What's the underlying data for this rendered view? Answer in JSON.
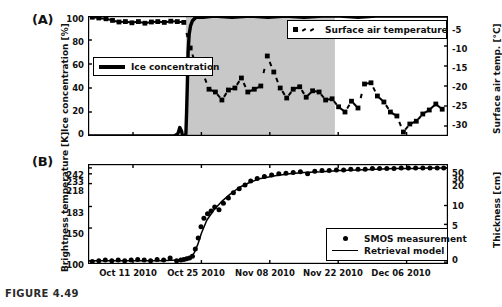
{
  "figure": {
    "caption": "FIGURE 4.49",
    "background_color": "#ffffff",
    "foreground_color": "#000000",
    "shade_color": "#c8c8c8"
  },
  "panels": [
    {
      "id": "A",
      "label": "(A)",
      "left_axis": {
        "title": "Ice concentration [%]",
        "ticks": [
          "0",
          "20",
          "40",
          "60",
          "80",
          "100"
        ],
        "tick_values": [
          0,
          20,
          40,
          60,
          80,
          100
        ],
        "range": [
          0,
          100
        ]
      },
      "right_axis": {
        "title": "Surface air temp. [°C]",
        "ticks": [
          "-5",
          "-10",
          "-15",
          "-20",
          "-25",
          "-30"
        ],
        "tick_values": [
          -5,
          -10,
          -15,
          -20,
          -25,
          -30
        ],
        "range": [
          -32.5,
          -2.5
        ]
      },
      "legends": [
        {
          "name": "ice-concentration-legend",
          "label": "Ice concentration",
          "key": "thick-line"
        },
        {
          "name": "surface-air-temperature-legend",
          "label": "Surface air temperature",
          "key": "dotted-square"
        }
      ],
      "shaded_region": {
        "x_start_frac": 0.272,
        "x_end_frac": 0.686
      }
    },
    {
      "id": "B",
      "label": "(B)",
      "left_axis": {
        "title": "Brightness temperature [K]",
        "ticks": [
          "242",
          "233",
          "218",
          "183",
          "150",
          "100"
        ],
        "tick_values": [
          242,
          233,
          218,
          183,
          150,
          100
        ],
        "range": [
          95,
          248
        ]
      },
      "right_axis": {
        "title": "Thickness [cm]",
        "ticks": [
          "50",
          "30",
          "20",
          "10",
          "5",
          "0"
        ],
        "tick_values": [
          50,
          30,
          20,
          10,
          5,
          0
        ],
        "range": [
          -1,
          52
        ]
      },
      "legends": [
        {
          "name": "smos-measurement-legend",
          "label": "SMOS measurement",
          "key": "dot"
        },
        {
          "name": "retrieval-model-legend",
          "label": "Retrieval model",
          "key": "thin-line"
        }
      ]
    }
  ],
  "x_axis": {
    "ticks": [
      "Oct 11 2010",
      "Oct 25 2010",
      "Nov 08 2010",
      "Nov 22 2010",
      "Dec 06 2010"
    ],
    "tick_fracs": [
      0.125,
      0.315,
      0.505,
      0.695,
      0.885
    ],
    "range_label": "Oct 2010 – Dec 2010"
  },
  "chart_data": [
    {
      "type": "line",
      "panel": "A",
      "title": "",
      "xlabel": "",
      "ylabel": "Ice concentration [%]",
      "ylabel_right": "Surface air temp. [°C]",
      "ylim": [
        0,
        100
      ],
      "ylim_right": [
        -32.5,
        -2.5
      ],
      "grid": false,
      "legend_position": "inside",
      "series": [
        {
          "name": "Ice concentration",
          "unit": "%",
          "axis": "left",
          "style": "thick-solid-line",
          "x_frac": [
            0.0,
            0.05,
            0.1,
            0.15,
            0.2,
            0.24,
            0.25,
            0.255,
            0.26,
            0.262,
            0.265,
            0.268,
            0.27,
            0.272,
            0.274,
            0.276,
            0.278,
            0.281,
            0.285,
            0.29,
            0.3,
            0.32,
            0.35,
            0.4,
            0.45,
            0.5,
            0.55,
            0.6,
            0.65,
            0.7,
            0.75,
            0.8,
            0.85,
            0.9,
            0.95,
            1.0
          ],
          "values": [
            0,
            0,
            0,
            0,
            0,
            0,
            2,
            7,
            4,
            1,
            0,
            0,
            0,
            2,
            20,
            45,
            70,
            85,
            92,
            96,
            99,
            99,
            100,
            99,
            100,
            99,
            100,
            99,
            100,
            100,
            99,
            100,
            100,
            100,
            100,
            100
          ]
        },
        {
          "name": "Surface air temperature",
          "unit": "°C",
          "axis": "right",
          "style": "dotted-with-square-markers",
          "x_frac": [
            0.012,
            0.03,
            0.05,
            0.068,
            0.086,
            0.104,
            0.122,
            0.14,
            0.158,
            0.176,
            0.194,
            0.212,
            0.23,
            0.248,
            0.266,
            0.284,
            0.3,
            0.318,
            0.336,
            0.354,
            0.372,
            0.39,
            0.408,
            0.426,
            0.444,
            0.462,
            0.48,
            0.498,
            0.516,
            0.534,
            0.552,
            0.57,
            0.588,
            0.606,
            0.624,
            0.642,
            0.66,
            0.678,
            0.696,
            0.714,
            0.732,
            0.75,
            0.768,
            0.786,
            0.804,
            0.822,
            0.84,
            0.858,
            0.876,
            0.894,
            0.912,
            0.93,
            0.948,
            0.966,
            0.984
          ],
          "values": [
            -2.8,
            -3.0,
            -3.2,
            -3.6,
            -4.0,
            -3.9,
            -4.2,
            -3.9,
            -4.3,
            -4.0,
            -3.9,
            -4.1,
            -3.8,
            -3.9,
            -4.1,
            -10.5,
            -14.8,
            -16.5,
            -20.8,
            -21.5,
            -23.5,
            -21.0,
            -20.5,
            -18.0,
            -21.5,
            -20.8,
            -20.0,
            -12.5,
            -16.5,
            -20.5,
            -23.0,
            -20.8,
            -20.2,
            -22.8,
            -21.2,
            -21.5,
            -23.5,
            -23.2,
            -25.2,
            -26.5,
            -23.8,
            -25.5,
            -19.5,
            -19.2,
            -22.5,
            -24.0,
            -26.5,
            -27.5,
            -31.5,
            -29.5,
            -28.8,
            -27.0,
            -26.0,
            -24.5,
            -25.8
          ]
        }
      ]
    },
    {
      "type": "line",
      "panel": "B",
      "title": "",
      "xlabel": "",
      "ylabel": "Brightness temperature [K]",
      "ylabel_right": "Thickness [cm]",
      "ylim": [
        95,
        248
      ],
      "ylim_right": [
        -1,
        52
      ],
      "grid": false,
      "legend_position": "lower-right",
      "series": [
        {
          "name": "SMOS measurement",
          "unit": "K",
          "axis": "left",
          "style": "filled-circle-markers",
          "x_frac": [
            0.012,
            0.03,
            0.048,
            0.066,
            0.084,
            0.102,
            0.12,
            0.138,
            0.156,
            0.174,
            0.192,
            0.21,
            0.228,
            0.246,
            0.258,
            0.266,
            0.274,
            0.282,
            0.29,
            0.298,
            0.306,
            0.314,
            0.322,
            0.332,
            0.342,
            0.352,
            0.364,
            0.376,
            0.39,
            0.404,
            0.42,
            0.436,
            0.452,
            0.47,
            0.49,
            0.51,
            0.53,
            0.55,
            0.57,
            0.59,
            0.61,
            0.63,
            0.65,
            0.67,
            0.69,
            0.71,
            0.73,
            0.75,
            0.77,
            0.79,
            0.81,
            0.83,
            0.85,
            0.87,
            0.89,
            0.91,
            0.93,
            0.95,
            0.97,
            0.988
          ],
          "values": [
            99,
            100,
            101,
            100,
            101,
            100,
            101,
            102,
            101,
            100,
            102,
            101,
            104,
            100,
            101,
            102,
            103,
            104,
            107,
            118,
            135,
            152,
            165,
            172,
            176,
            182,
            178,
            188,
            196,
            204,
            210,
            216,
            222,
            226,
            229,
            231,
            233,
            234,
            235,
            236,
            233,
            237,
            238,
            238,
            239,
            239,
            240,
            240,
            240,
            241,
            241,
            241,
            241,
            242,
            242,
            242,
            242,
            242,
            242,
            242
          ]
        },
        {
          "name": "Retrieval model",
          "unit": "K",
          "axis": "left",
          "style": "thin-solid-line",
          "x_frac": [
            0.0,
            0.1,
            0.2,
            0.25,
            0.27,
            0.285,
            0.295,
            0.305,
            0.315,
            0.33,
            0.35,
            0.37,
            0.395,
            0.42,
            0.45,
            0.48,
            0.52,
            0.56,
            0.6,
            0.65,
            0.7,
            0.75,
            0.8,
            0.85,
            0.9,
            0.95,
            1.0
          ],
          "values": [
            100,
            100,
            100,
            101,
            102,
            105,
            112,
            125,
            142,
            162,
            178,
            190,
            202,
            212,
            220,
            226,
            230,
            233,
            235,
            236,
            238,
            239,
            240,
            241,
            241,
            242,
            242
          ]
        }
      ]
    }
  ]
}
